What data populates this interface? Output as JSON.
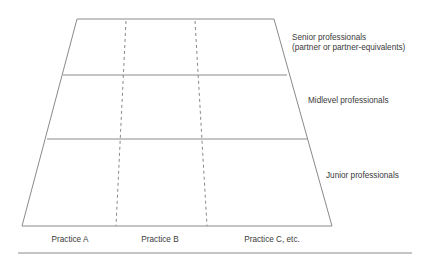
{
  "diagram": {
    "type": "matrix-trapezoid",
    "colors": {
      "line": "#8a8a8a",
      "dashed": "#7a7a7a",
      "text": "#3a3a3a",
      "background": "#ffffff"
    },
    "rows": [
      {
        "label_line1": "Senior professionals",
        "label_line2": "(partner or partner-equivalents)"
      },
      {
        "label_line1": "Midlevel professionals"
      },
      {
        "label_line1": "Junior professionals"
      }
    ],
    "columns": [
      {
        "label": "Practice A"
      },
      {
        "label": "Practice B"
      },
      {
        "label": "Practice C, etc."
      }
    ]
  }
}
